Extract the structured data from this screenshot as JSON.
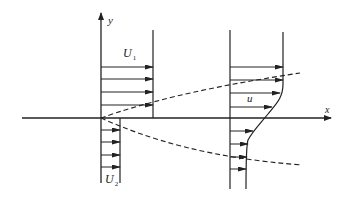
{
  "diagram": {
    "labels": {
      "y_axis": "y",
      "x_axis": "x",
      "upper_velocity": "U",
      "upper_velocity_sub": "1",
      "lower_velocity": "U",
      "lower_velocity_sub": "2",
      "local_velocity": "u"
    },
    "profiles": [
      {
        "name": "inlet-profile",
        "description": "step velocity profile: U1 above splitter, U2 below",
        "upper_arrows": 4,
        "lower_arrows": 4
      },
      {
        "name": "downstream-profile",
        "description": "smooth velocity profile u(y) across mixing layer",
        "upper_arrows": 4,
        "lower_arrows": 4
      }
    ],
    "mixing_layer_boundaries": [
      "upper-dashed-boundary",
      "lower-dashed-boundary"
    ],
    "colors": {
      "line": "#222222",
      "background": "#ffffff"
    }
  }
}
